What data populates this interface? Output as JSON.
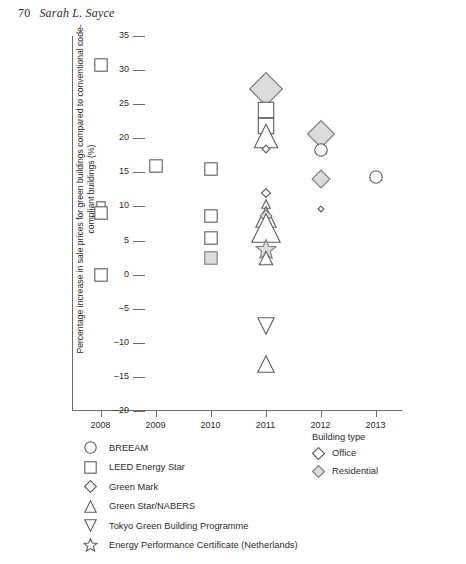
{
  "page_header": {
    "folio": "70",
    "author": "Sarah L. Sayce"
  },
  "chart_data": {
    "type": "scatter",
    "title": "",
    "xlabel": "",
    "ylabel": "Percentage increase in sale prices for green buildings compared to conventional code-compliant buildings (%)",
    "xlim": [
      2007.5,
      2013.5
    ],
    "ylim": [
      -20,
      35
    ],
    "xticks": [
      "2008",
      "2009",
      "2010",
      "2011",
      "2012",
      "2013"
    ],
    "yticks": [
      "35",
      "30",
      "25",
      "20",
      "15",
      "10",
      "5",
      "0",
      "-5",
      "-10",
      "-15",
      "-20"
    ],
    "grid": false,
    "legend_position": "below-left",
    "marker_legend": {
      "entries": [
        {
          "shape": "circle",
          "label": "BREEAM"
        },
        {
          "shape": "square",
          "label": "LEED Energy Star"
        },
        {
          "shape": "diamond",
          "label": "Green Mark"
        },
        {
          "shape": "triangle-up",
          "label": "Green Star/NABERS"
        },
        {
          "shape": "triangle-down",
          "label": "Tokyo Green Building Programme"
        },
        {
          "shape": "star",
          "label": "Energy Performance Certificate (Netherlands)"
        }
      ]
    },
    "building_type_legend": {
      "title": "Building type",
      "entries": [
        {
          "shape": "diamond",
          "fill": "office",
          "label": "Office"
        },
        {
          "shape": "diamond",
          "fill": "residential",
          "label": "Residential"
        }
      ]
    },
    "colors": {
      "stroke": "#5c5c5c",
      "office_fill": "#ffffff",
      "residential_fill": "#dcdcdc",
      "axis": "#6d6d6d"
    },
    "points": [
      {
        "year": 2008,
        "value": 30.8,
        "shape": "square",
        "fill": "office",
        "size": 14
      },
      {
        "year": 2008,
        "value": 10.0,
        "shape": "square",
        "fill": "office",
        "size": 10
      },
      {
        "year": 2008,
        "value": 9.0,
        "shape": "square",
        "fill": "office",
        "size": 14
      },
      {
        "year": 2008,
        "value": 0.0,
        "shape": "square",
        "fill": "office",
        "size": 14
      },
      {
        "year": 2009,
        "value": 16.0,
        "shape": "square",
        "fill": "office",
        "size": 14
      },
      {
        "year": 2010,
        "value": 15.5,
        "shape": "square",
        "fill": "office",
        "size": 14
      },
      {
        "year": 2010,
        "value": 8.6,
        "shape": "square",
        "fill": "office",
        "size": 14
      },
      {
        "year": 2010,
        "value": 5.4,
        "shape": "square",
        "fill": "office",
        "size": 14
      },
      {
        "year": 2010,
        "value": 2.5,
        "shape": "square",
        "fill": "residential",
        "size": 14
      },
      {
        "year": 2011,
        "value": 27.3,
        "shape": "diamond",
        "fill": "residential",
        "size": 34
      },
      {
        "year": 2011,
        "value": 24.1,
        "shape": "square",
        "fill": "office",
        "size": 17
      },
      {
        "year": 2011,
        "value": 21.8,
        "shape": "square",
        "fill": "office",
        "size": 17
      },
      {
        "year": 2011,
        "value": 20.3,
        "shape": "triangle-up",
        "fill": "office",
        "size": 25
      },
      {
        "year": 2011,
        "value": 18.4,
        "shape": "diamond",
        "fill": "office",
        "size": 9
      },
      {
        "year": 2011,
        "value": 12.0,
        "shape": "diamond",
        "fill": "office",
        "size": 10
      },
      {
        "year": 2011,
        "value": 10.4,
        "shape": "triangle-up",
        "fill": "office",
        "size": 10
      },
      {
        "year": 2011,
        "value": 8.5,
        "shape": "triangle-up",
        "fill": "office",
        "size": 22
      },
      {
        "year": 2011,
        "value": 8.6,
        "shape": "diamond",
        "fill": "residential",
        "size": 13
      },
      {
        "year": 2011,
        "value": 6.8,
        "shape": "triangle-up",
        "fill": "office",
        "size": 30
      },
      {
        "year": 2011,
        "value": 3.6,
        "shape": "star",
        "fill": "residential",
        "size": 22
      },
      {
        "year": 2011,
        "value": 2.4,
        "shape": "triangle-up",
        "fill": "office",
        "size": 15
      },
      {
        "year": 2011,
        "value": -7.5,
        "shape": "triangle-down",
        "fill": "office",
        "size": 18
      },
      {
        "year": 2011,
        "value": -13.1,
        "shape": "triangle-up",
        "fill": "office",
        "size": 18
      },
      {
        "year": 2012,
        "value": 20.6,
        "shape": "diamond",
        "fill": "residential",
        "size": 28
      },
      {
        "year": 2012,
        "value": 18.3,
        "shape": "circle",
        "fill": "office",
        "size": 14
      },
      {
        "year": 2012,
        "value": 14.1,
        "shape": "diamond",
        "fill": "residential",
        "size": 19
      },
      {
        "year": 2012,
        "value": 9.6,
        "shape": "diamond",
        "fill": "office",
        "size": 7
      },
      {
        "year": 2013,
        "value": 14.3,
        "shape": "circle",
        "fill": "office",
        "size": 14
      }
    ]
  }
}
